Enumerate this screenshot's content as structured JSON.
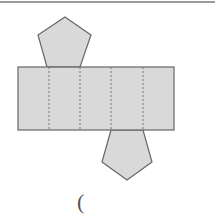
{
  "diagram": {
    "type": "net-of-pentagonal-prism",
    "colors": {
      "fill": "#d9d9d9",
      "stroke": "#666666",
      "dash": "#777777",
      "top_rule": "#9a9a9a"
    },
    "rectangle": {
      "x": 18,
      "y": 67,
      "width": 156,
      "height": 63
    },
    "fold_lines_x": [
      49,
      80,
      111,
      143
    ],
    "top_pentagon_points": "47,67 38,35 65,17 91,35 80,67",
    "bottom_pentagon_points": "111,130 102,162 127,180 152,162 143,130",
    "answer_blank": "("
  }
}
